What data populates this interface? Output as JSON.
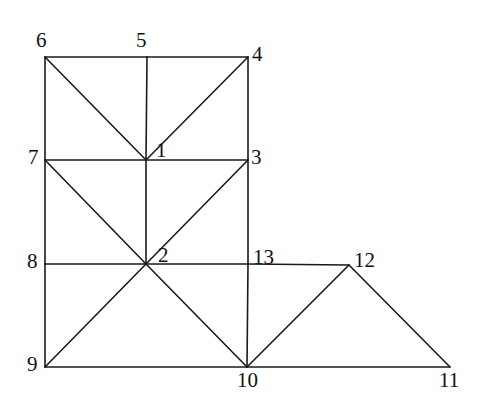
{
  "diagram": {
    "type": "mesh-graph",
    "colors": {
      "line": "#1a1a1a",
      "text": "#111111",
      "background": "#ffffff"
    },
    "nodes": [
      {
        "id": "1",
        "x": 146,
        "y": 160,
        "label": "1",
        "lx": 156,
        "ly": 140
      },
      {
        "id": "2",
        "x": 146,
        "y": 264,
        "label": "2",
        "lx": 158,
        "ly": 245
      },
      {
        "id": "3",
        "x": 248,
        "y": 160,
        "label": "3",
        "lx": 251,
        "ly": 147
      },
      {
        "id": "4",
        "x": 248,
        "y": 57,
        "label": "4",
        "lx": 252,
        "ly": 44
      },
      {
        "id": "5",
        "x": 147,
        "y": 57,
        "label": "5",
        "lx": 136,
        "ly": 30
      },
      {
        "id": "6",
        "x": 45,
        "y": 57,
        "label": "6",
        "lx": 36,
        "ly": 30
      },
      {
        "id": "7",
        "x": 45,
        "y": 160,
        "label": "7",
        "lx": 28,
        "ly": 147
      },
      {
        "id": "8",
        "x": 45,
        "y": 264,
        "label": "8",
        "lx": 27,
        "ly": 251
      },
      {
        "id": "9",
        "x": 45,
        "y": 367,
        "label": "9",
        "lx": 27,
        "ly": 354
      },
      {
        "id": "10",
        "x": 247,
        "y": 367,
        "label": "10",
        "lx": 237,
        "ly": 370
      },
      {
        "id": "11",
        "x": 450,
        "y": 367,
        "label": "11",
        "lx": 439,
        "ly": 370
      },
      {
        "id": "12",
        "x": 349,
        "y": 265,
        "label": "12",
        "lx": 354,
        "ly": 250
      },
      {
        "id": "13",
        "x": 248,
        "y": 264,
        "label": "13",
        "lx": 253,
        "ly": 247
      }
    ],
    "edges": [
      [
        "6",
        "5"
      ],
      [
        "5",
        "4"
      ],
      [
        "6",
        "7"
      ],
      [
        "7",
        "8"
      ],
      [
        "8",
        "9"
      ],
      [
        "9",
        "10"
      ],
      [
        "10",
        "11"
      ],
      [
        "4",
        "3"
      ],
      [
        "3",
        "13"
      ],
      [
        "13",
        "10"
      ],
      [
        "5",
        "1"
      ],
      [
        "1",
        "2"
      ],
      [
        "7",
        "1"
      ],
      [
        "1",
        "3"
      ],
      [
        "8",
        "2"
      ],
      [
        "2",
        "13"
      ],
      [
        "13",
        "12"
      ],
      [
        "6",
        "1"
      ],
      [
        "4",
        "1"
      ],
      [
        "7",
        "2"
      ],
      [
        "3",
        "2"
      ],
      [
        "9",
        "2"
      ],
      [
        "2",
        "10"
      ],
      [
        "10",
        "12"
      ],
      [
        "12",
        "11"
      ]
    ]
  }
}
